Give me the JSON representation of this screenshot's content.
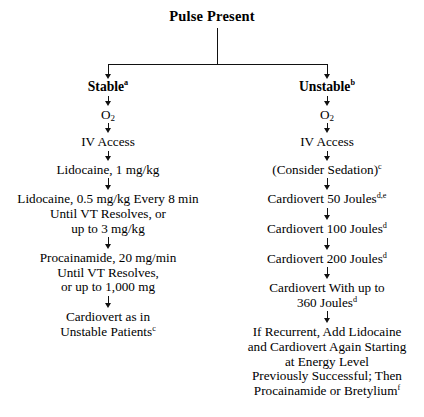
{
  "diagram": {
    "title": "Pulse Present",
    "branches": [
      {
        "id": "stable",
        "heading": "Stable",
        "heading_sup": "a",
        "steps": [
          {
            "lines": [
              "O2"
            ],
            "sup": "",
            "oxygen": true
          },
          {
            "lines": [
              "IV Access"
            ],
            "sup": ""
          },
          {
            "lines": [
              "Lidocaine, 1 mg/kg"
            ],
            "sup": ""
          },
          {
            "lines": [
              "Lidocaine, 0.5 mg/kg Every 8 min",
              "Until VT Resolves, or",
              "up to 3 mg/kg"
            ],
            "sup": ""
          },
          {
            "lines": [
              "Procainamide, 20 mg/min",
              "Until VT Resolves,",
              "or up to 1,000 mg"
            ],
            "sup": ""
          },
          {
            "lines": [
              "Cardiovert as in",
              "Unstable Patients"
            ],
            "sup": "c"
          }
        ]
      },
      {
        "id": "unstable",
        "heading": "Unstable",
        "heading_sup": "b",
        "steps": [
          {
            "lines": [
              "O2"
            ],
            "sup": "",
            "oxygen": true
          },
          {
            "lines": [
              "IV Access"
            ],
            "sup": ""
          },
          {
            "lines": [
              "(Consider Sedation)"
            ],
            "sup": "c"
          },
          {
            "lines": [
              "Cardiovert 50 Joules"
            ],
            "sup": "d,e"
          },
          {
            "lines": [
              "Cardiovert 100 Joules"
            ],
            "sup": "d"
          },
          {
            "lines": [
              "Cardiovert 200 Joules"
            ],
            "sup": "d"
          },
          {
            "lines": [
              "Cardiovert With up to",
              "360 Joules"
            ],
            "sup": "d"
          },
          {
            "lines": [
              "If Recurrent, Add Lidocaine",
              "and Cardiovert Again Starting",
              "at Energy Level",
              "Previously Successful; Then",
              "Procainamide or Bretylium"
            ],
            "sup": "f"
          }
        ]
      }
    ],
    "colors": {
      "ink": "#000000",
      "background": "#ffffff",
      "connector": "#111111"
    }
  }
}
